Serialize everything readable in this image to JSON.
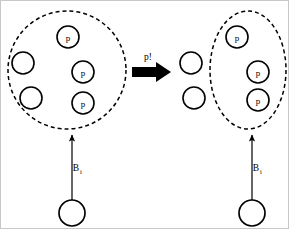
{
  "figure": {
    "type": "state-transition-diagram",
    "background_color": "#ffffff",
    "stroke_color": "#000000",
    "width": 289,
    "height": 229
  },
  "transition": {
    "label": "p!",
    "direction": "left-to-right",
    "arrow_style": "thick-solid-block"
  },
  "left_panel": {
    "region": {
      "shape": "ellipse",
      "style": "dashed",
      "cx": 66,
      "cy": 69,
      "rx": 59,
      "ry": 59
    },
    "nodes": [
      {
        "label": "p",
        "cx": 67,
        "cy": 36,
        "r": 11,
        "inside_region": true
      },
      {
        "label": "",
        "cx": 22,
        "cy": 62,
        "r": 11,
        "inside_region": true
      },
      {
        "label": "p",
        "cx": 82,
        "cy": 71,
        "r": 11,
        "inside_region": true
      },
      {
        "label": "",
        "cx": 30,
        "cy": 97,
        "r": 11,
        "inside_region": true
      },
      {
        "label": "p",
        "cx": 82,
        "cy": 102,
        "r": 11,
        "inside_region": true
      }
    ],
    "source_node": {
      "label": "",
      "cx": 71,
      "cy": 212,
      "r": 13
    },
    "edge": {
      "label_base": "B",
      "label_sub": "i",
      "from_x": 71,
      "from_y": 199,
      "to_x": 71,
      "to_y": 132
    }
  },
  "right_panel": {
    "region": {
      "shape": "ellipse",
      "style": "dashed",
      "cx": 247,
      "cy": 69,
      "rx": 38,
      "ry": 59
    },
    "nodes": [
      {
        "label": "p",
        "cx": 236,
        "cy": 36,
        "r": 11,
        "inside_region": true
      },
      {
        "label": "",
        "cx": 190,
        "cy": 62,
        "r": 11,
        "inside_region": false
      },
      {
        "label": "p",
        "cx": 257,
        "cy": 71,
        "r": 11,
        "inside_region": true
      },
      {
        "label": "",
        "cx": 193,
        "cy": 97,
        "r": 11,
        "inside_region": false
      },
      {
        "label": "p",
        "cx": 257,
        "cy": 99,
        "r": 11,
        "inside_region": true
      }
    ],
    "source_node": {
      "label": "",
      "cx": 251,
      "cy": 212,
      "r": 13
    },
    "edge": {
      "label_base": "B",
      "label_sub": "i",
      "from_x": 251,
      "from_y": 199,
      "to_x": 251,
      "to_y": 132
    }
  }
}
